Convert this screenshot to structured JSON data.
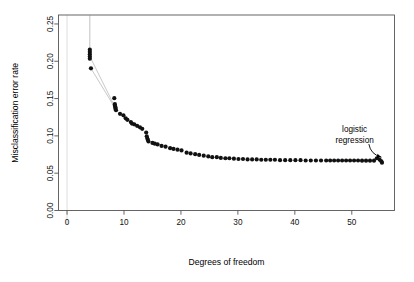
{
  "figure": {
    "background_color": "#ffffff",
    "width": 414,
    "height": 282
  },
  "chart_data": {
    "type": "scatter",
    "title": "",
    "subtitle": "",
    "xlabel": "Degrees of freedom",
    "ylabel": "Misclassification error rate",
    "xlim": [
      -1.5,
      57.5
    ],
    "ylim": [
      0.0,
      0.262
    ],
    "xticks": [
      0,
      10,
      20,
      30,
      40,
      50
    ],
    "xtick_labels": [
      "0",
      "10",
      "20",
      "30",
      "40",
      "50"
    ],
    "yticks": [
      0.0,
      0.05,
      0.1,
      0.15,
      0.2,
      0.25
    ],
    "ytick_labels": [
      "0.00",
      "0.05",
      "0.10",
      "0.15",
      "0.20",
      "0.25"
    ],
    "grid": false,
    "legend": null,
    "legend_position": "none",
    "marker": "filled-circle",
    "marker_color": "#111111",
    "marker_size": 2.1,
    "reference_lines": [
      {
        "name": "zero-df-vertical-guide",
        "orientation": "vertical",
        "x": 0.0,
        "color": "#d9d9d9"
      }
    ],
    "connector_lines": [
      {
        "name": "spike-to-top",
        "color": "#8e8e8e",
        "points": [
          [
            4.0,
            0.262
          ],
          [
            4.0,
            0.2155
          ]
        ]
      },
      {
        "name": "sliver-upper",
        "color": "#9a9a9a",
        "points": [
          [
            4.0,
            0.2065
          ],
          [
            8.3,
            0.1405
          ]
        ]
      },
      {
        "name": "sliver-lower",
        "color": "#9a9a9a",
        "points": [
          [
            4.2,
            0.1905
          ],
          [
            8.5,
            0.1365
          ]
        ]
      }
    ],
    "annotations": [
      {
        "name": "logistic-regression-label",
        "text_lines": [
          "logistic",
          "regression"
        ],
        "text_x": 50.5,
        "text_y": 0.105,
        "arrow_from": [
          53.0,
          0.089
        ],
        "arrow_to": [
          55.2,
          0.0715
        ],
        "color": "#000000"
      }
    ],
    "x": [
      4.0,
      4.0,
      4.0,
      4.0,
      4.0,
      4.2,
      8.3,
      8.4,
      8.4,
      8.5,
      8.5,
      8.6,
      9.3,
      9.9,
      10.3,
      10.6,
      11.2,
      11.4,
      11.8,
      12.3,
      12.8,
      13.2,
      13.9,
      14.0,
      14.1,
      14.2,
      14.3,
      15.0,
      15.4,
      15.9,
      16.6,
      17.3,
      18.1,
      18.7,
      19.4,
      20.1,
      21.0,
      21.7,
      22.5,
      23.2,
      24.0,
      24.8,
      25.5,
      26.3,
      27.0,
      27.8,
      28.5,
      29.3,
      30.1,
      30.9,
      31.7,
      32.5,
      33.3,
      34.1,
      34.9,
      35.7,
      36.5,
      37.4,
      38.3,
      39.2,
      40.1,
      41.0,
      41.9,
      42.8,
      43.7,
      44.6,
      45.5,
      46.2,
      46.9,
      47.6,
      48.3,
      49.0,
      49.7,
      50.4,
      51.1,
      51.8,
      52.5,
      53.2,
      53.9,
      54.4,
      54.9,
      55.2,
      55.3
    ],
    "y": [
      0.2155,
      0.2125,
      0.2095,
      0.2065,
      0.2035,
      0.1905,
      0.1505,
      0.1425,
      0.1405,
      0.1385,
      0.1365,
      0.1345,
      0.1295,
      0.1275,
      0.1235,
      0.1215,
      0.1185,
      0.1165,
      0.1155,
      0.1135,
      0.1115,
      0.1095,
      0.1045,
      0.0995,
      0.0965,
      0.0945,
      0.0925,
      0.0905,
      0.0895,
      0.0885,
      0.0865,
      0.0855,
      0.0835,
      0.0825,
      0.0815,
      0.0805,
      0.0775,
      0.0765,
      0.0755,
      0.0745,
      0.0735,
      0.0725,
      0.0715,
      0.0715,
      0.0705,
      0.07,
      0.07,
      0.0695,
      0.069,
      0.069,
      0.0685,
      0.0685,
      0.0685,
      0.068,
      0.068,
      0.068,
      0.068,
      0.0675,
      0.0675,
      0.0675,
      0.0675,
      0.0675,
      0.067,
      0.067,
      0.067,
      0.067,
      0.067,
      0.067,
      0.067,
      0.067,
      0.067,
      0.067,
      0.067,
      0.067,
      0.067,
      0.0668,
      0.0668,
      0.0668,
      0.0668,
      0.07,
      0.068,
      0.066,
      0.064
    ]
  }
}
